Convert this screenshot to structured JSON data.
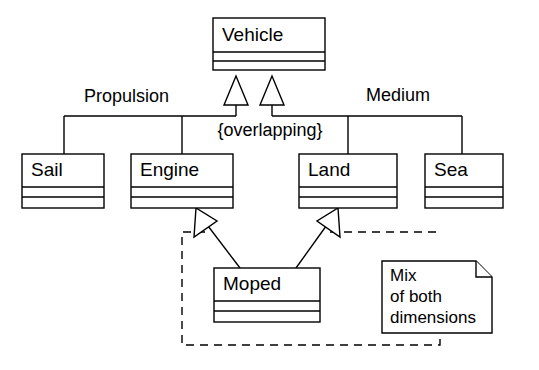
{
  "diagram": {
    "notation": "UML class diagram",
    "background_color": "#ffffff",
    "line_color": "#000000",
    "fill_color": "#ffffff"
  },
  "classes": {
    "vehicle": {
      "name": "Vehicle",
      "x": 213,
      "y": 18,
      "w": 112,
      "h": 52
    },
    "sail": {
      "name": "Sail",
      "x": 22,
      "y": 154,
      "w": 82,
      "h": 54
    },
    "engine": {
      "name": "Engine",
      "x": 131,
      "y": 154,
      "w": 102,
      "h": 54
    },
    "land": {
      "name": "Land",
      "x": 299,
      "y": 154,
      "w": 98,
      "h": 54
    },
    "sea": {
      "name": "Sea",
      "x": 425,
      "y": 154,
      "w": 78,
      "h": 54
    },
    "moped": {
      "name": "Moped",
      "x": 214,
      "y": 268,
      "w": 106,
      "h": 54
    }
  },
  "edge_labels": {
    "propulsion": {
      "text": "Propulsion",
      "x": 84,
      "y": 97
    },
    "medium": {
      "text": "Medium",
      "x": 366,
      "y": 96
    }
  },
  "constraint": {
    "text": "{overlapping}",
    "x": 270,
    "y": 131
  },
  "note": {
    "lines": [
      "Mix",
      "of both",
      "dimensions"
    ],
    "x": 382,
    "y": 261,
    "w": 110,
    "h": 72,
    "fold": 16
  },
  "generalization_sets": [
    {
      "name": "Propulsion",
      "children": [
        "Sail",
        "Engine"
      ]
    },
    {
      "name": "Medium",
      "children": [
        "Land",
        "Sea"
      ]
    }
  ],
  "multiple_inheritance": {
    "child": "Moped",
    "parents": [
      "Engine",
      "Land"
    ]
  },
  "boundary": {
    "kind": "dashed-constraint-region",
    "x": 182,
    "y": 232,
    "w": 258,
    "h": 113
  }
}
